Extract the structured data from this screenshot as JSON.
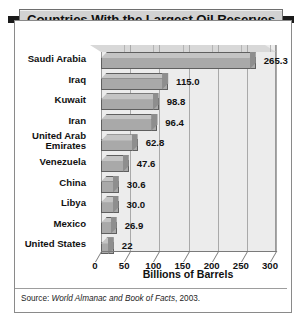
{
  "title": "Countries With the Largest Oil Reserves",
  "source": {
    "prefix": "Source: ",
    "italic": "World Almanac and Book of Facts",
    "suffix": ", 2003."
  },
  "axis": {
    "x_title": "Billions of Barrels",
    "x_ticks": [
      "0",
      "50",
      "100",
      "150",
      "200",
      "250",
      "300"
    ]
  },
  "chart_data": {
    "type": "bar",
    "orientation": "horizontal",
    "title": "Countries With the Largest Oil Reserves",
    "xlabel": "Billions of Barrels",
    "ylabel": "",
    "xlim": [
      0,
      300
    ],
    "grid": true,
    "legend": "none",
    "categories": [
      "Saudi Arabia",
      "Iraq",
      "Kuwait",
      "Iran",
      "United Arab Emirates",
      "Venezuela",
      "China",
      "Libya",
      "Mexico",
      "United States"
    ],
    "values": [
      265.3,
      115.0,
      98.8,
      96.4,
      62.8,
      47.6,
      30.6,
      30.0,
      26.9,
      22
    ],
    "data_labels": [
      "265.3",
      "115.0",
      "98.8",
      "96.4",
      "62.8",
      "47.6",
      "30.6",
      "30.0",
      "26.9",
      "22"
    ],
    "label_lines": [
      [
        "Saudi Arabia"
      ],
      [
        "Iraq"
      ],
      [
        "Kuwait"
      ],
      [
        "Iran"
      ],
      [
        "United Arab",
        "Emirates"
      ],
      [
        "Venezuela"
      ],
      [
        "China"
      ],
      [
        "Libya"
      ],
      [
        "Mexico"
      ],
      [
        "United States"
      ]
    ],
    "source_note": "Source: World Almanac and Book of Facts, 2003.",
    "colors": {
      "bar_face": "#a9a9a9",
      "bar_top": "#c4c4c4",
      "bar_side": "#8e8e8e",
      "bar_edge": "#5f5f5f",
      "panel": "#ececec",
      "panel_top": "#d8d8d8",
      "grid": "#a9a9a9",
      "title_banner": "#d2d2d2",
      "text": "#111111"
    }
  }
}
